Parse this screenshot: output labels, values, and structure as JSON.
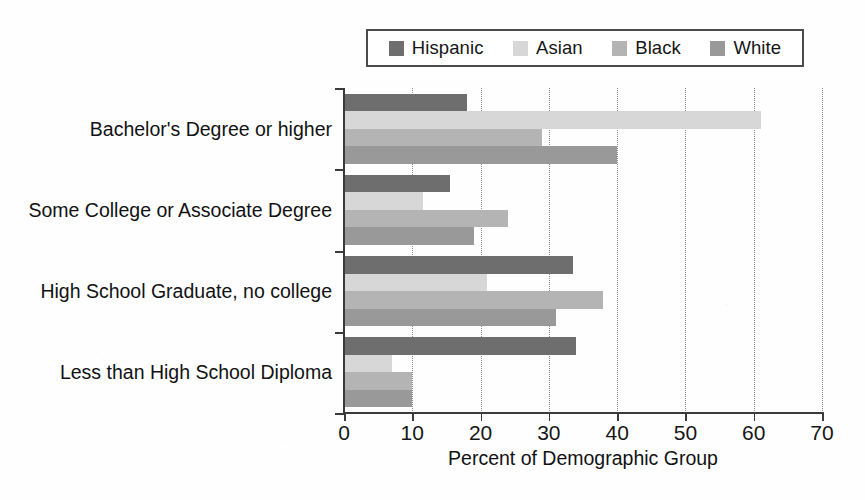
{
  "chart_data": {
    "type": "bar",
    "orientation": "horizontal",
    "title": "",
    "xlabel": "Percent of Demographic Group",
    "ylabel": "",
    "xlim": [
      0,
      70
    ],
    "xticks": [
      0,
      10,
      20,
      30,
      40,
      50,
      60,
      70
    ],
    "grid": "vertical-dotted",
    "legend_position": "top-center",
    "categories": [
      "Bachelor's Degree or higher",
      "Some College or Associate Degree",
      "High School Graduate, no college",
      "Less than High School Diploma"
    ],
    "series": [
      {
        "name": "Hispanic",
        "color": "#6e6e6e",
        "values": [
          18,
          15.5,
          33.5,
          34
        ]
      },
      {
        "name": "Asian",
        "color": "#d7d7d7",
        "values": [
          61,
          11.5,
          21,
          7
        ]
      },
      {
        "name": "Black",
        "color": "#b4b4b4",
        "values": [
          29,
          24,
          38,
          10
        ]
      },
      {
        "name": "White",
        "color": "#999999",
        "values": [
          40,
          19,
          31,
          10
        ]
      }
    ]
  },
  "legend": {
    "entries": [
      {
        "label": "Hispanic",
        "color": "#6e6e6e"
      },
      {
        "label": "Asian",
        "color": "#d7d7d7"
      },
      {
        "label": "Black",
        "color": "#b4b4b4"
      },
      {
        "label": "White",
        "color": "#999999"
      }
    ]
  },
  "axis": {
    "x_title": "Percent of Demographic Group",
    "x_ticklabels": [
      "0",
      "10",
      "20",
      "30",
      "40",
      "50",
      "60",
      "70"
    ]
  },
  "colors": {
    "axis": "#3b3b3b",
    "grid": "#8c8c8c",
    "text": "#121212",
    "background": "#fefefe"
  }
}
